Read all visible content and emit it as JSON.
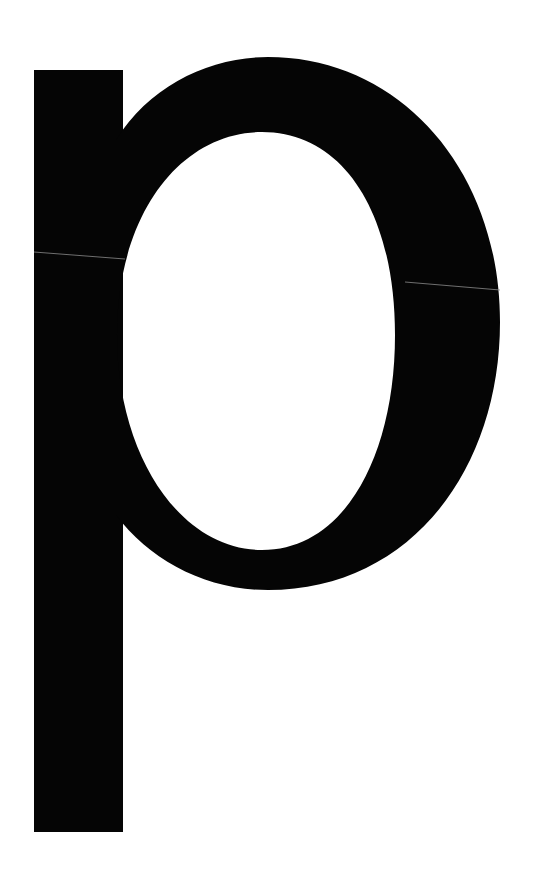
{
  "glyph": {
    "character": "p",
    "description": "Large lowercase letter p",
    "fill_color": "#050505",
    "background_color": "#ffffff",
    "seam_color": "#8a8a8a"
  }
}
